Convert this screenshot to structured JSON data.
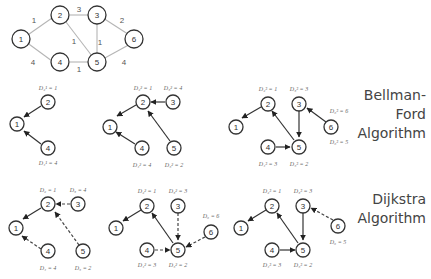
{
  "labels": {
    "bellman_ford_line1": "Bellman-Ford",
    "bellman_ford_line2": "Algorithm",
    "dijkstra_line1": "Dijkstra",
    "dijkstra_line2": "Algorithm"
  },
  "original_graph": {
    "nodes": [
      "1",
      "2",
      "3",
      "4",
      "5",
      "6"
    ],
    "edges": [
      {
        "from": "1",
        "to": "2",
        "weight": "1"
      },
      {
        "from": "2",
        "to": "3",
        "weight": "3"
      },
      {
        "from": "3",
        "to": "6",
        "weight": "2"
      },
      {
        "from": "1",
        "to": "4",
        "weight": "4"
      },
      {
        "from": "4",
        "to": "5",
        "weight": "1"
      },
      {
        "from": "5",
        "to": "6",
        "weight": "4"
      },
      {
        "from": "2",
        "to": "5",
        "weight": "1"
      },
      {
        "from": "3",
        "to": "5",
        "weight": "1"
      }
    ]
  },
  "bellman_ford": [
    {
      "step": 1,
      "distances": {
        "2": "D₂¹ = 1",
        "4": "D₄¹ = 4"
      }
    },
    {
      "step": 2,
      "distances": {
        "2": "D₂² = 1",
        "3": "D₃² = 4",
        "4": "D₄² = 4",
        "5": "D₅² = 2"
      }
    },
    {
      "step": 3,
      "distances": {
        "2": "D₂³ = 1",
        "3": "D₃³ = 3",
        "4": "D₄³ = 3",
        "5": "D₅³ = 2",
        "6a": "D₆³ = 6",
        "6b": "D₆³ = 5"
      }
    }
  ],
  "dijkstra": [
    {
      "step": 1,
      "distances": {
        "2": "D₂ = 1",
        "3": "D₃ = 4",
        "4": "D₄ = 4",
        "5": "D₅ = 2"
      }
    },
    {
      "step": 2,
      "distances": {
        "2": "D₂² = 1",
        "3": "D₃² = 3",
        "4": "D₄² = 3",
        "5": "D₅² = 2",
        "6": "D₆ = 6"
      }
    },
    {
      "step": 3,
      "distances": {
        "2": "D₂³ = 1",
        "3": "D₃³ = 3",
        "4": "D₄³ = 3",
        "5": "D₅³ = 2",
        "6": "D₆ = 5"
      }
    }
  ]
}
